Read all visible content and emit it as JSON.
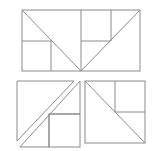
{
  "diagram": {
    "stroke_color": "#8a8a8a",
    "background": "#ffffff",
    "figures": [
      {
        "name": "top-rectangle",
        "rect": [
          22,
          10,
          118,
          61
        ],
        "lines": [
          [
            22,
            10,
            81,
            71
          ],
          [
            81,
            71,
            140,
            10
          ],
          [
            81,
            10,
            81,
            71
          ],
          [
            22,
            41,
            51,
            41
          ],
          [
            51,
            41,
            51,
            71
          ],
          [
            81,
            41,
            111,
            41
          ],
          [
            111,
            10,
            111,
            41
          ]
        ]
      },
      {
        "name": "bottom-left-square",
        "polygons": [
          [
            [
              17,
              81
            ],
            [
              74,
              81
            ],
            [
              17,
              141
            ]
          ],
          [
            [
              80,
              81
            ],
            [
              80,
              114
            ],
            [
              49,
              114
            ],
            [
              49,
              147
            ],
            [
              20,
              147
            ]
          ],
          [
            [
              49,
              114
            ],
            [
              80,
              114
            ],
            [
              80,
              147
            ],
            [
              49,
              147
            ]
          ]
        ]
      },
      {
        "name": "bottom-right-square",
        "rect": [
          85,
          81,
          60,
          62
        ],
        "lines": [
          [
            85,
            81,
            145,
            143
          ],
          [
            115,
            81,
            115,
            112
          ],
          [
            115,
            112,
            145,
            112
          ]
        ]
      }
    ]
  }
}
